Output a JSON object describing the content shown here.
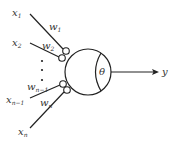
{
  "diagram": {
    "title": "",
    "inputs": [
      {
        "var": "x",
        "sub": "1",
        "weight_var": "w",
        "weight_sub": "1"
      },
      {
        "var": "x",
        "sub": "2",
        "weight_var": "w",
        "weight_sub": "2"
      },
      {
        "var": "x",
        "sub": "n−1",
        "weight_var": "w",
        "weight_sub": "n−1"
      },
      {
        "var": "x",
        "sub": "n",
        "weight_var": "w",
        "weight_sub": "n"
      }
    ],
    "ellipsis": "⋮",
    "neuron": {
      "threshold_label": "θ"
    },
    "output": {
      "label": "y"
    },
    "colors": {
      "stroke": "#222222",
      "text": "#333333",
      "background": "#ffffff"
    }
  }
}
